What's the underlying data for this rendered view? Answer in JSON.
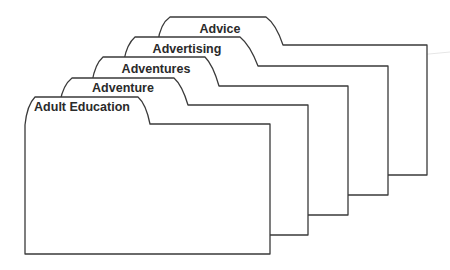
{
  "folders": [
    {
      "label": "Advice",
      "order": 1
    },
    {
      "label": "Advertising",
      "order": 2
    },
    {
      "label": "Adventures",
      "order": 3
    },
    {
      "label": "Adventure",
      "order": 4
    },
    {
      "label": "Adult Education",
      "order": 5
    }
  ],
  "colors": {
    "stroke": "#3a3a3a",
    "fill": "#ffffff",
    "text": "#2a2a2a"
  }
}
